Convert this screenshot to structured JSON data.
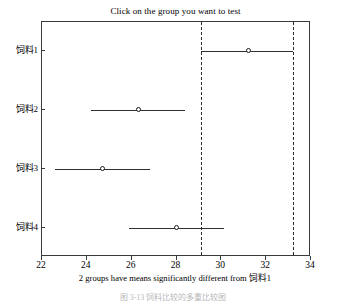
{
  "chart_data": {
    "type": "scatter",
    "title": "Click on the group you want to test",
    "xlabel": "2 groups have means significantly different from 饲料1",
    "ylabel": "",
    "xlim": [
      22,
      34
    ],
    "xticks": [
      22,
      24,
      26,
      28,
      30,
      32,
      34
    ],
    "xtick_labels": [
      "22",
      "24",
      "26",
      "28",
      "30",
      "32",
      "34"
    ],
    "categories": [
      "饲料1",
      "饲料2",
      "饲料3",
      "饲料4"
    ],
    "grid": false,
    "legend": false,
    "series": [
      {
        "name": "group-mean-with-ci",
        "points": [
          {
            "group": "饲料1",
            "mean": 31.2,
            "ci_low": 29.1,
            "ci_high": 33.2
          },
          {
            "group": "饲料2",
            "mean": 26.3,
            "ci_low": 24.2,
            "ci_high": 28.4
          },
          {
            "group": "饲料3",
            "mean": 24.7,
            "ci_low": 22.6,
            "ci_high": 26.8
          },
          {
            "group": "饲料4",
            "mean": 28.0,
            "ci_low": 25.9,
            "ci_high": 30.1
          }
        ]
      }
    ],
    "reference_lines": [
      {
        "name": "selected-ci-lower",
        "value": 29.1,
        "style": "dashed"
      },
      {
        "name": "selected-ci-upper",
        "value": 33.2,
        "style": "dashed"
      }
    ],
    "annotations": []
  },
  "caption": {
    "text": "图 3-13  饲料比较的多重比较图"
  }
}
